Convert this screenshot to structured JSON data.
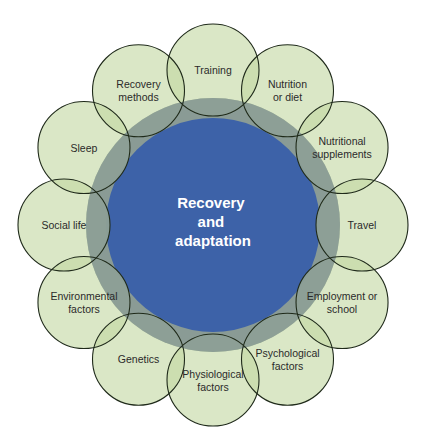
{
  "diagram": {
    "type": "radial-venn",
    "center": {
      "lines": [
        "Recovery",
        "and",
        "adaptation"
      ],
      "color": "#3d62a8",
      "ring_color": "#8a9b95"
    },
    "satellite_fill": "#dce9c9",
    "satellite_stroke": "#1f2a1a",
    "factors": [
      {
        "lines": [
          "Training"
        ]
      },
      {
        "lines": [
          "Nutrition",
          "or diet"
        ]
      },
      {
        "lines": [
          "Nutritional",
          "supplements"
        ]
      },
      {
        "lines": [
          "Travel"
        ]
      },
      {
        "lines": [
          "Employment or",
          "school"
        ]
      },
      {
        "lines": [
          "Psychological",
          "factors"
        ]
      },
      {
        "lines": [
          "Physiological",
          "factors"
        ]
      },
      {
        "lines": [
          "Genetics"
        ]
      },
      {
        "lines": [
          "Environmental",
          "factors"
        ]
      },
      {
        "lines": [
          "Social life"
        ]
      },
      {
        "lines": [
          "Sleep"
        ]
      },
      {
        "lines": [
          "Recovery",
          "methods"
        ]
      }
    ]
  }
}
